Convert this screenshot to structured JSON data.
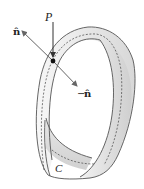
{
  "figure": {
    "labels": {
      "normal": "n̂",
      "neg_normal_sign": "−",
      "neg_normal": "n̂",
      "point": "P",
      "curve": "C"
    },
    "colors": {
      "strip_fill_light": "#f4f4f4",
      "strip_fill_dark": "#d4d4d4",
      "outline": "#555555",
      "arrow": "#666666",
      "point": "#111111"
    }
  }
}
